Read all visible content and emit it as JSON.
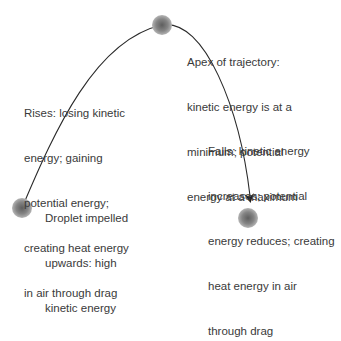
{
  "diagram": {
    "droplets": [
      {
        "id": "launch",
        "cx": 22,
        "cy": 208,
        "r": 10
      },
      {
        "id": "apex",
        "cx": 162,
        "cy": 25,
        "r": 10
      },
      {
        "id": "landing",
        "cx": 248,
        "cy": 218,
        "r": 10
      }
    ],
    "colors": {
      "droplet_center": "#6e6e6e",
      "droplet_edge": "#a8a8a8",
      "path": "#2a2a2a",
      "text": "#3a3a3a"
    },
    "labels": {
      "rises": [
        "Rises: losing kinetic",
        "energy; gaining",
        "potential energy;",
        "creating heat energy",
        "in air through drag"
      ],
      "apex": [
        "Apex of trajectory:",
        "kinetic energy is at a",
        "minimum; potential",
        "energy at a maximum"
      ],
      "falls": [
        "Falls: kinetic energy",
        "increases; potential",
        "energy reduces; creating",
        "heat energy in air",
        "through drag"
      ],
      "droplet": [
        "Droplet impelled",
        "upwards: high",
        "kinetic energy"
      ]
    }
  }
}
